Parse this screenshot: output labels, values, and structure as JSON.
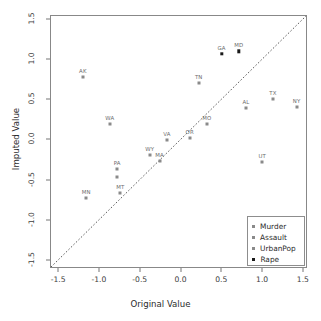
{
  "chart_data": {
    "type": "scatter",
    "title": "",
    "xlabel": "Original Value",
    "ylabel": "Imputed Value",
    "xlim": [
      -1.6,
      1.55
    ],
    "ylim": [
      -1.6,
      1.55
    ],
    "xticks": [
      "-1.5",
      "-1.0",
      "-0.5",
      "0.0",
      "0.5",
      "1.0",
      "1.5"
    ],
    "xtickvals": [
      -1.5,
      -1.0,
      -0.5,
      0.0,
      0.5,
      1.0,
      1.5
    ],
    "yticks": [
      "-1.5",
      "-1.0",
      "-0.5",
      "0.0",
      "0.5",
      "1.0",
      "1.5"
    ],
    "ytickvals": [
      -1.5,
      -1.0,
      -0.5,
      0.0,
      0.5,
      1.0,
      1.5
    ],
    "grid": false,
    "reference_line": {
      "type": "identity",
      "style": "dotted",
      "from": [
        -1.6,
        -1.6
      ],
      "to": [
        1.55,
        1.55
      ]
    },
    "legend_position": "bottom-right",
    "series": [
      {
        "name": "Murder",
        "marker": "open-square",
        "color": "#8a8a8a"
      },
      {
        "name": "Assault",
        "marker": "open-square",
        "color": "#8a8a8a"
      },
      {
        "name": "UrbanPop",
        "marker": "open-square",
        "color": "#8a8a8a"
      },
      {
        "name": "Rape",
        "marker": "filled-square",
        "color": "#1a1a1a"
      }
    ],
    "points": [
      {
        "label": "AK",
        "x": -1.21,
        "y": 0.79,
        "series": "Assault"
      },
      {
        "label": "WA",
        "x": -0.88,
        "y": 0.2,
        "series": "UrbanPop"
      },
      {
        "label": "MN",
        "x": -1.17,
        "y": -0.71,
        "series": "Murder"
      },
      {
        "label": "PA",
        "x": -0.79,
        "y": -0.35,
        "series": "Assault"
      },
      {
        "label": "PA2",
        "x": -0.79,
        "y": -0.46,
        "series": "UrbanPop"
      },
      {
        "label": "MT",
        "x": -0.75,
        "y": -0.65,
        "series": "Murder"
      },
      {
        "label": "WY",
        "x": -0.39,
        "y": -0.18,
        "series": "UrbanPop"
      },
      {
        "label": "MA",
        "x": -0.27,
        "y": -0.25,
        "series": "Murder"
      },
      {
        "label": "VA",
        "x": -0.18,
        "y": 0.0,
        "series": "Assault"
      },
      {
        "label": "OR",
        "x": 0.1,
        "y": 0.03,
        "series": "UrbanPop"
      },
      {
        "label": "MO",
        "x": 0.31,
        "y": 0.21,
        "series": "Assault"
      },
      {
        "label": "TN",
        "x": 0.21,
        "y": 0.72,
        "series": "Murder"
      },
      {
        "label": "GA",
        "x": 0.49,
        "y": 1.08,
        "series": "Rape"
      },
      {
        "label": "MD",
        "x": 0.7,
        "y": 1.11,
        "series": "Rape"
      },
      {
        "label": "AL",
        "x": 0.79,
        "y": 0.4,
        "series": "Murder"
      },
      {
        "label": "TX",
        "x": 1.12,
        "y": 0.52,
        "series": "Assault"
      },
      {
        "label": "NY",
        "x": 1.41,
        "y": 0.42,
        "series": "UrbanPop"
      },
      {
        "label": "UT",
        "x": 0.99,
        "y": -0.27,
        "series": "UrbanPop"
      }
    ]
  },
  "legend": {
    "items": [
      {
        "label": "Murder"
      },
      {
        "label": "Assault"
      },
      {
        "label": "UrbanPop"
      },
      {
        "label": "Rape"
      }
    ]
  }
}
